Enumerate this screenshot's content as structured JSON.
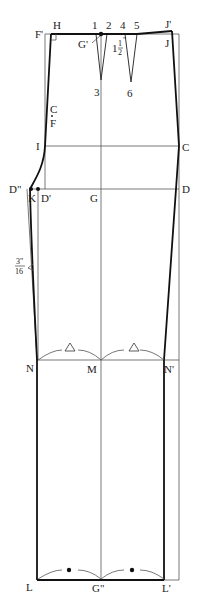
{
  "diagram": {
    "type": "trouser-front-pattern-draft",
    "points": {
      "F_prime": "F'",
      "H": "H",
      "p1": "1",
      "p2": "2",
      "G_prime": "G'",
      "p3": "3",
      "p4": "4",
      "p5": "5",
      "p6": "6",
      "J_prime": "J'",
      "J": "J",
      "CF_top": "C",
      "CF_bottom": "F",
      "I": "I",
      "C": "C",
      "D_dprime": "D\"",
      "K": "K",
      "D_prime": "D'",
      "G": "G",
      "D": "D",
      "N": "N",
      "M": "M",
      "N_prime": "N'",
      "L": "L",
      "G_dprime": "G\"",
      "L_prime": "L'"
    },
    "measurements": {
      "dart_depth_whole": "1",
      "dart_depth_num": "1",
      "dart_depth_den": "2",
      "dart_depth_unit": "\"",
      "seam_offset_num": "3\"",
      "seam_offset_den": "16"
    },
    "symbols": {
      "knee_equal_mark": "triangle",
      "hem_equal_mark": "dot"
    }
  }
}
